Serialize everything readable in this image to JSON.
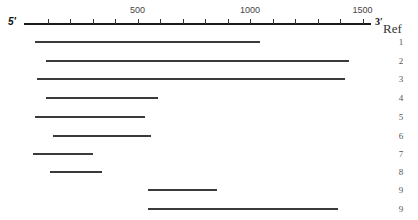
{
  "axis": {
    "start_label": "5′",
    "end_label": "3′",
    "ticks": [
      {
        "value": 100,
        "label": ""
      },
      {
        "value": 200,
        "label": ""
      },
      {
        "value": 300,
        "label": ""
      },
      {
        "value": 400,
        "label": ""
      },
      {
        "value": 500,
        "label": "500"
      },
      {
        "value": 600,
        "label": ""
      },
      {
        "value": 700,
        "label": ""
      },
      {
        "value": 800,
        "label": ""
      },
      {
        "value": 900,
        "label": ""
      },
      {
        "value": 1000,
        "label": "1000"
      },
      {
        "value": 1100,
        "label": ""
      },
      {
        "value": 1200,
        "label": ""
      },
      {
        "value": 1300,
        "label": ""
      },
      {
        "value": 1400,
        "label": ""
      },
      {
        "value": 1500,
        "label": "1500"
      }
    ],
    "range": [
      0,
      1540
    ]
  },
  "ref_header": "Ref",
  "fragments": [
    {
      "ref": "1",
      "start": 45,
      "end": 1045
    },
    {
      "ref": "2",
      "start": 95,
      "end": 1440
    },
    {
      "ref": "3",
      "start": 55,
      "end": 1420
    },
    {
      "ref": "4",
      "start": 95,
      "end": 590
    },
    {
      "ref": "5",
      "start": 45,
      "end": 535
    },
    {
      "ref": "6",
      "start": 125,
      "end": 560
    },
    {
      "ref": "7",
      "start": 35,
      "end": 300
    },
    {
      "ref": "8",
      "start": 110,
      "end": 340
    },
    {
      "ref": "9",
      "start": 545,
      "end": 855
    },
    {
      "ref": "9",
      "start": 545,
      "end": 1390
    }
  ],
  "colors": {
    "axis": "#1a1a1a",
    "fragment": "#3a3a3a",
    "text": "#444444"
  }
}
